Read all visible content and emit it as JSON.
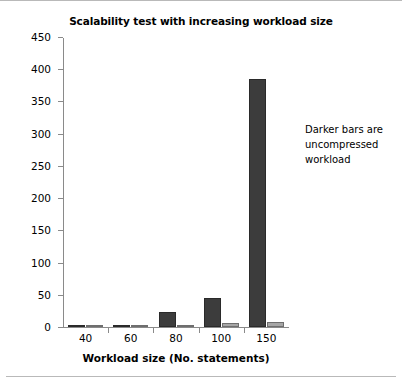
{
  "chart_data": {
    "type": "bar",
    "title": "Scalability test with increasing workload size",
    "xlabel": "Workload size (No. statements)",
    "ylabel": "Advisor execution time ratio",
    "categories": [
      "40",
      "60",
      "80",
      "100",
      "150"
    ],
    "series": [
      {
        "name": "uncompressed workload",
        "color": "#3c3c3c",
        "values": [
          0.5,
          2,
          23,
          45,
          385
        ]
      },
      {
        "name": "compressed workload",
        "color": "#a6a6a6",
        "values": [
          0.3,
          2,
          3,
          7,
          8
        ]
      }
    ],
    "ylim": [
      0,
      450
    ],
    "yticks": [
      "0",
      "50",
      "100",
      "150",
      "200",
      "250",
      "300",
      "350",
      "400",
      "450"
    ],
    "ytick_values": [
      0,
      50,
      100,
      150,
      200,
      250,
      300,
      350,
      400,
      450
    ],
    "grid": false,
    "legend": "none",
    "annotations": [
      {
        "text": "Darker bars are uncompressed workload",
        "lines": [
          "Darker bars are",
          "uncompressed",
          "workload"
        ]
      }
    ]
  }
}
